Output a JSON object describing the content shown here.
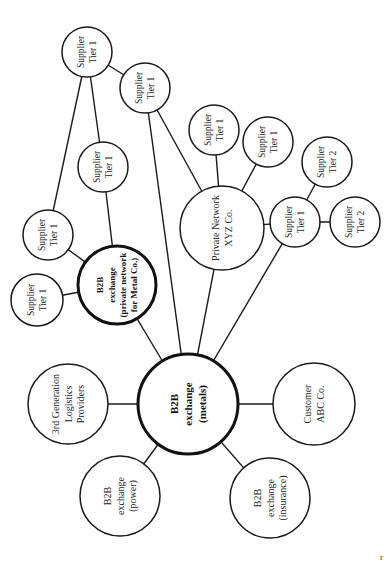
{
  "diagram": {
    "orientation": "rotated-90-ccw",
    "colors": {
      "line": "#1a1a1a",
      "fill": "#ffffff",
      "text": "#222222"
    },
    "nodes": [
      {
        "id": "hub",
        "lines": [
          "B2B",
          "exchange",
          "(metals)"
        ],
        "bold": true,
        "cx": 188,
        "cy": 404,
        "r": 50,
        "fs": 11
      },
      {
        "id": "metal",
        "lines": [
          "B2B",
          "exchange",
          "(private network",
          "for Metal Co.)"
        ],
        "bold": true,
        "cx": 117,
        "cy": 285,
        "r": 39,
        "fs": 9
      },
      {
        "id": "logistics",
        "lines": [
          "3rd Generation",
          "Logistics",
          "Providers"
        ],
        "bold": false,
        "cx": 68,
        "cy": 404,
        "r": 40,
        "fs": 10
      },
      {
        "id": "power",
        "lines": [
          "B2B",
          "exchange",
          "(power)"
        ],
        "bold": false,
        "cx": 120,
        "cy": 496,
        "r": 40,
        "fs": 10
      },
      {
        "id": "insurance",
        "lines": [
          "B2B",
          "exchange",
          "(insurance)"
        ],
        "bold": false,
        "cx": 270,
        "cy": 498,
        "r": 40,
        "fs": 10
      },
      {
        "id": "customer",
        "lines": [
          "Customer",
          "ABC Co."
        ],
        "bold": false,
        "cx": 314,
        "cy": 404,
        "r": 41,
        "fs": 10
      },
      {
        "id": "xyz",
        "lines": [
          "Private Network",
          "XYZ Co."
        ],
        "bold": false,
        "cx": 222,
        "cy": 228,
        "r": 42,
        "fs": 10
      },
      {
        "id": "s_a",
        "lines": [
          "Supplier",
          "Tier 1"
        ],
        "bold": false,
        "cx": 37,
        "cy": 300,
        "r": 26,
        "fs": 9.5
      },
      {
        "id": "s_b",
        "lines": [
          "Supplier",
          "Tier 1"
        ],
        "bold": false,
        "cx": 48,
        "cy": 235,
        "r": 25,
        "fs": 9.5
      },
      {
        "id": "s_c",
        "lines": [
          "Supplier",
          "Tier 1"
        ],
        "bold": false,
        "cx": 103,
        "cy": 167,
        "r": 25,
        "fs": 9.5
      },
      {
        "id": "s_d",
        "lines": [
          "Supplier",
          "Tier 1"
        ],
        "bold": false,
        "cx": 87,
        "cy": 52,
        "r": 25,
        "fs": 9.5
      },
      {
        "id": "s_e",
        "lines": [
          "Supplier",
          "Tier 1"
        ],
        "bold": false,
        "cx": 145,
        "cy": 88,
        "r": 25,
        "fs": 9.5
      },
      {
        "id": "s_f",
        "lines": [
          "Supplier",
          "Tier 1"
        ],
        "bold": false,
        "cx": 214,
        "cy": 130,
        "r": 25,
        "fs": 9.5
      },
      {
        "id": "s_g",
        "lines": [
          "Supplier",
          "Tier 1"
        ],
        "bold": false,
        "cx": 268,
        "cy": 142,
        "r": 25,
        "fs": 9.5
      },
      {
        "id": "s_h",
        "lines": [
          "Supplier",
          "Tier 1"
        ],
        "bold": false,
        "cx": 295,
        "cy": 222,
        "r": 25,
        "fs": 9.5
      },
      {
        "id": "s_i",
        "lines": [
          "Supplier",
          "Tier 2"
        ],
        "bold": false,
        "cx": 327,
        "cy": 162,
        "r": 25,
        "fs": 9.5
      },
      {
        "id": "s_j",
        "lines": [
          "Supplier",
          "Tier 2"
        ],
        "bold": false,
        "cx": 355,
        "cy": 222,
        "r": 25,
        "fs": 9.5
      }
    ],
    "edges": [
      [
        "hub",
        "metal"
      ],
      [
        "hub",
        "logistics"
      ],
      [
        "hub",
        "power"
      ],
      [
        "hub",
        "insurance"
      ],
      [
        "hub",
        "customer"
      ],
      [
        "hub",
        "xyz"
      ],
      [
        "hub",
        "s_h"
      ],
      [
        "hub",
        "s_e"
      ],
      [
        "metal",
        "s_a"
      ],
      [
        "metal",
        "s_b"
      ],
      [
        "metal",
        "s_c"
      ],
      [
        "s_b",
        "s_d"
      ],
      [
        "s_c",
        "s_d"
      ],
      [
        "s_d",
        "s_e"
      ],
      [
        "s_e",
        "xyz"
      ],
      [
        "xyz",
        "s_f"
      ],
      [
        "xyz",
        "s_g"
      ],
      [
        "xyz",
        "s_h"
      ],
      [
        "s_h",
        "s_i"
      ],
      [
        "s_h",
        "s_j"
      ]
    ],
    "corner_mark": "r"
  }
}
